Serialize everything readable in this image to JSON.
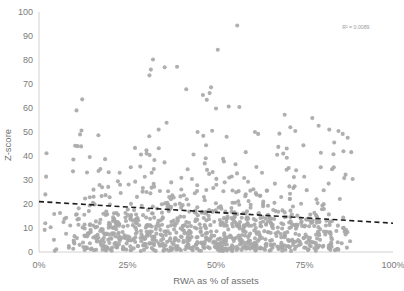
{
  "chart_data": {
    "type": "scatter",
    "title": "",
    "xlabel": "RWA as %  of assets",
    "ylabel": "Z-score",
    "xlim": [
      0,
      100
    ],
    "ylim": [
      0,
      100
    ],
    "xticks": [
      0,
      25,
      50,
      75,
      100
    ],
    "xtick_labels": [
      "0%",
      "25%",
      "50%",
      "75%",
      "100%"
    ],
    "yticks": [
      0,
      10,
      20,
      30,
      40,
      50,
      60,
      70,
      80,
      90,
      100
    ],
    "ytick_labels": [
      "0",
      "10",
      "20",
      "30",
      "40",
      "50",
      "60",
      "70",
      "80",
      "90",
      "100"
    ],
    "grid": false,
    "legend": null,
    "annotations": [
      {
        "name": "r-squared",
        "text": "R² = 0.0089",
        "x_pct": 89.5,
        "y_pct": 93.0
      }
    ],
    "marker": {
      "shape": "circle",
      "color": "#a8a8a8",
      "size_px": 4.1,
      "opacity": 0.92
    },
    "trendline": {
      "type": "linear",
      "style": "dashed",
      "color": "#1d1d1d",
      "width_px": 1.6,
      "dash": "5,3.4",
      "intercept": 21.0,
      "slope": -0.09,
      "x_start": 0,
      "x_end": 100,
      "y_start": 21.0,
      "y_end": 12.0
    },
    "axes_style": {
      "line_color": "#d2d2d2",
      "line_width_px": 1,
      "left_axis": true,
      "bottom_axis": true,
      "top_axis": false,
      "right_axis": false
    },
    "n_points": 1020,
    "x_distribution": {
      "note": "density rises sharply after 12%, plateaus 20-75%, tapers to ~88%",
      "min_observed": 1.5,
      "max_observed": 88.5,
      "mode": 48
    },
    "y_distribution": {
      "note": "heavily right-skewed; bulk between 0 and 30, sparse tail up to 94",
      "median": 12,
      "bulk_max": 32,
      "max_observed": 94.4
    },
    "notable_points": [
      {
        "x": 56.0,
        "y": 94.4
      },
      {
        "x": 50.5,
        "y": 84.3
      },
      {
        "x": 32.2,
        "y": 80.2
      },
      {
        "x": 31.6,
        "y": 76.0
      },
      {
        "x": 31.2,
        "y": 73.6
      },
      {
        "x": 35.5,
        "y": 77.0
      },
      {
        "x": 39.0,
        "y": 77.2
      },
      {
        "x": 41.6,
        "y": 67.8
      },
      {
        "x": 48.6,
        "y": 68.6
      },
      {
        "x": 48.2,
        "y": 66.2
      },
      {
        "x": 46.3,
        "y": 65.4
      },
      {
        "x": 47.4,
        "y": 63.4
      },
      {
        "x": 50.0,
        "y": 59.8
      },
      {
        "x": 12.2,
        "y": 63.6
      },
      {
        "x": 10.6,
        "y": 59.0
      },
      {
        "x": 53.6,
        "y": 60.6
      },
      {
        "x": 56.6,
        "y": 60.4
      },
      {
        "x": 69.4,
        "y": 57.2
      },
      {
        "x": 77.2,
        "y": 55.8
      },
      {
        "x": 12.0,
        "y": 50.6
      },
      {
        "x": 11.6,
        "y": 49.0
      },
      {
        "x": 10.2,
        "y": 44.3
      },
      {
        "x": 10.9,
        "y": 44.1
      },
      {
        "x": 11.9,
        "y": 44.0
      },
      {
        "x": 33.8,
        "y": 51.0
      },
      {
        "x": 44.8,
        "y": 50.0
      },
      {
        "x": 46.4,
        "y": 48.4
      },
      {
        "x": 53.0,
        "y": 48.0
      },
      {
        "x": 61.0,
        "y": 50.0
      },
      {
        "x": 61.9,
        "y": 49.2
      },
      {
        "x": 71.0,
        "y": 52.0
      },
      {
        "x": 72.4,
        "y": 50.4
      },
      {
        "x": 79.0,
        "y": 52.6
      },
      {
        "x": 82.0,
        "y": 51.0
      },
      {
        "x": 84.6,
        "y": 50.4
      },
      {
        "x": 85.8,
        "y": 49.2
      },
      {
        "x": 87.2,
        "y": 47.6
      },
      {
        "x": 83.4,
        "y": 45.6
      },
      {
        "x": 86.0,
        "y": 42.0
      },
      {
        "x": 88.2,
        "y": 41.6
      },
      {
        "x": 67.6,
        "y": 43.8
      },
      {
        "x": 69.0,
        "y": 41.0
      },
      {
        "x": 58.4,
        "y": 41.6
      },
      {
        "x": 30.4,
        "y": 41.0
      },
      {
        "x": 52.0,
        "y": 38.8
      },
      {
        "x": 88.6,
        "y": 30.4
      },
      {
        "x": 2.0,
        "y": 31.4
      },
      {
        "x": 9.6,
        "y": 33.6
      },
      {
        "x": 1.8,
        "y": 24.0
      },
      {
        "x": 1.6,
        "y": 9.2
      },
      {
        "x": 72.0,
        "y": 31.2
      },
      {
        "x": 63.0,
        "y": 33.0
      }
    ]
  },
  "plot_geometry": {
    "left_px": 39,
    "right_px": 393,
    "top_px": 12,
    "bottom_px": 252,
    "width_px": 404,
    "height_px": 291
  }
}
